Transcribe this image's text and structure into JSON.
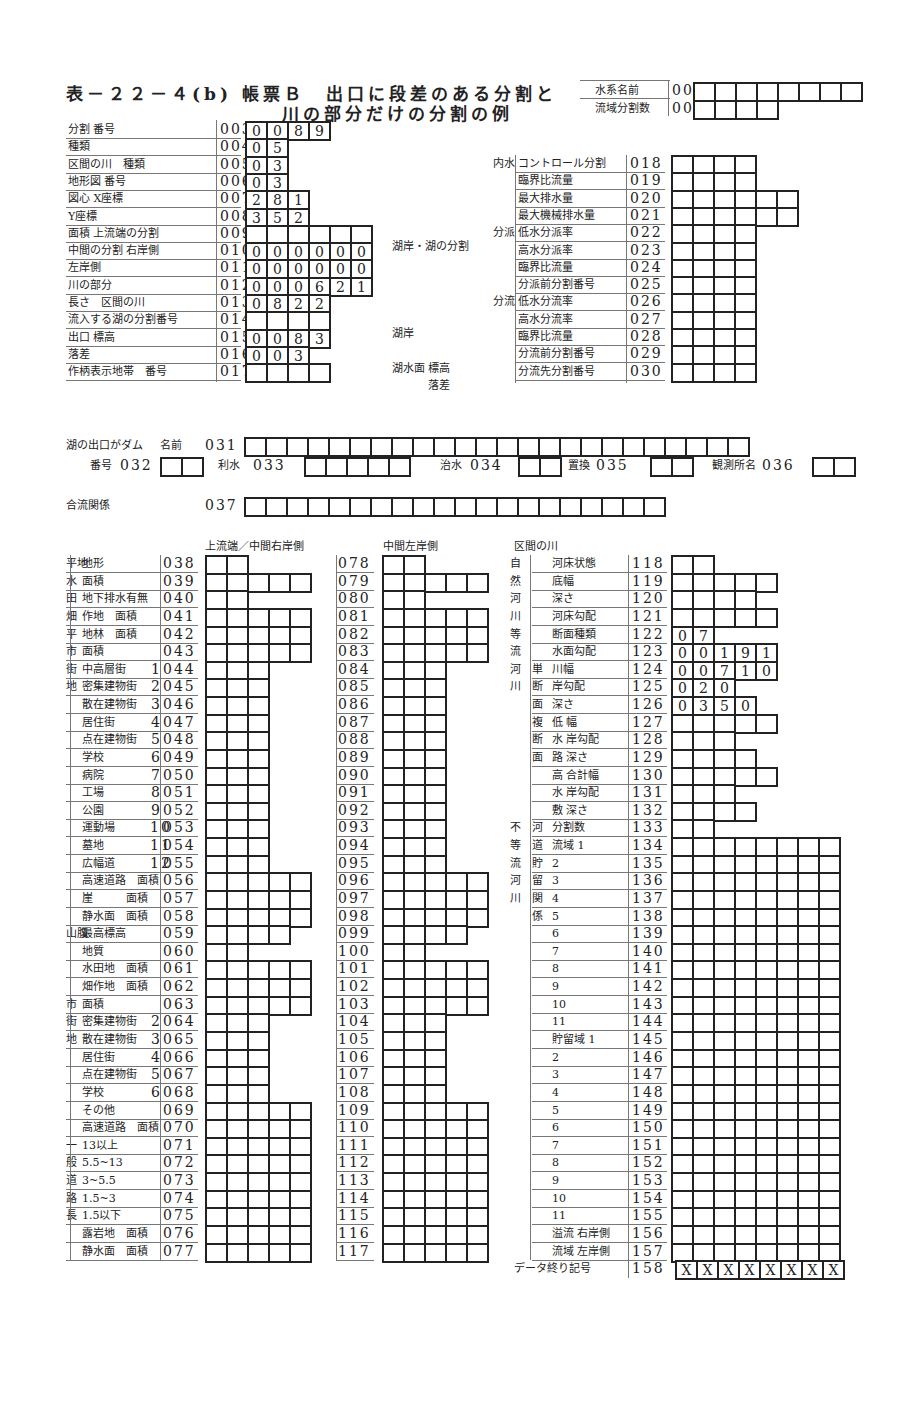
{
  "title": {
    "line1": "表－２２－４(b) 帳票Ｂ　出口に段差のある分割と",
    "line2": "川の部分だけの分割の例"
  },
  "header_fields": [
    {
      "label": "水系名前",
      "code": "001",
      "boxes": 8,
      "values": []
    },
    {
      "label": "流域分割数",
      "code": "002",
      "boxes": 4,
      "values": []
    }
  ],
  "section_top_left": [
    {
      "label": "分割 番号",
      "code": "003",
      "boxes": 4,
      "values": [
        "0",
        "0",
        "8",
        "9"
      ]
    },
    {
      "label": "種類",
      "code": "004",
      "boxes": 2,
      "values": [
        "0",
        "5"
      ]
    },
    {
      "label": "区間の川　種類",
      "code": "005",
      "boxes": 2,
      "values": [
        "0",
        "3"
      ]
    },
    {
      "label": "地形図 番号",
      "code": "006",
      "boxes": 2,
      "values": [
        "0",
        "3"
      ]
    },
    {
      "label": "図心 X座標",
      "code": "007",
      "boxes": 3,
      "values": [
        "2",
        "8",
        "1"
      ]
    },
    {
      "label": "Y座標",
      "code": "008",
      "boxes": 3,
      "values": [
        "3",
        "5",
        "2"
      ]
    },
    {
      "label": "面積 上流端の分割",
      "code": "009",
      "boxes": 6,
      "values": []
    },
    {
      "label": "中間の分割 右岸側",
      "code": "010",
      "boxes": 6,
      "values": [
        "0",
        "0",
        "0",
        "0",
        "0",
        "0"
      ]
    },
    {
      "label": "左岸側",
      "code": "011",
      "boxes": 6,
      "values": [
        "0",
        "0",
        "0",
        "0",
        "0",
        "0"
      ]
    },
    {
      "label": "川の部分",
      "code": "012",
      "boxes": 6,
      "values": [
        "0",
        "0",
        "0",
        "6",
        "2",
        "1"
      ]
    },
    {
      "label": "長さ　区間の川",
      "code": "013",
      "boxes": 4,
      "values": [
        "0",
        "8",
        "2",
        "2"
      ]
    },
    {
      "label": "流入する湖の分割番号",
      "code": "014",
      "boxes": 4,
      "values": []
    },
    {
      "label": "出口 標高",
      "code": "015",
      "boxes": 4,
      "values": [
        "0",
        "0",
        "8",
        "3"
      ]
    },
    {
      "label": "落差",
      "code": "016",
      "boxes": 3,
      "values": [
        "0",
        "0",
        "3"
      ]
    },
    {
      "label": "作柄表示地帯　番号",
      "code": "017",
      "boxes": 4,
      "values": []
    }
  ],
  "middle_labels": {
    "lake_shore_division": "湖岸・湖の分割",
    "lake_shore": "湖岸",
    "lake_surface_elev": "湖水面 標高",
    "drop": "落差"
  },
  "section_top_right": [
    {
      "group": "内水",
      "label": "コントロール分割",
      "code": "018",
      "boxes": 4
    },
    {
      "group": "",
      "label": "臨界比流量",
      "code": "019",
      "boxes": 4
    },
    {
      "group": "",
      "label": "最大排水量",
      "code": "020",
      "boxes": 6
    },
    {
      "group": "",
      "label": "最大機械排水量",
      "code": "021",
      "boxes": 6
    },
    {
      "group": "分派",
      "label": "低水分派率",
      "code": "022",
      "boxes": 4
    },
    {
      "group": "",
      "label": "高水分派率",
      "code": "023",
      "boxes": 4
    },
    {
      "group": "",
      "label": "臨界比流量",
      "code": "024",
      "boxes": 4
    },
    {
      "group": "",
      "label": "分派前分割番号",
      "code": "025",
      "boxes": 4
    },
    {
      "group": "分流",
      "label": "低水分流率",
      "code": "026",
      "boxes": 4
    },
    {
      "group": "",
      "label": "高水分流率",
      "code": "027",
      "boxes": 4
    },
    {
      "group": "",
      "label": "臨界比流量",
      "code": "028",
      "boxes": 4
    },
    {
      "group": "",
      "label": "分流前分割番号",
      "code": "029",
      "boxes": 4
    },
    {
      "group": "",
      "label": "分流先分割番号",
      "code": "030",
      "boxes": 4
    }
  ],
  "dam": {
    "label": "湖の出口がダム",
    "name_label": "名前",
    "name_code": "031",
    "name_boxes": 24,
    "number_label": "番号",
    "number_code": "032",
    "number_boxes": 2,
    "irrigation_label": "利水",
    "irrigation_code": "033",
    "irrigation_boxes": 5,
    "flood_label": "治水",
    "flood_code": "034",
    "flood_boxes": 2,
    "replace_label": "置換",
    "replace_code": "035",
    "replace_boxes": 2,
    "station_label": "観測所名",
    "station_code": "036",
    "station_boxes": 2
  },
  "confluence": {
    "label": "合流関係",
    "code": "037",
    "boxes": 20
  },
  "column_headers": {
    "upstream_right": "上流端／中間右岸側",
    "middle_left": "中間左岸側",
    "section_river": "区間の川"
  },
  "land_rows": [
    {
      "group": "平地",
      "label": "地形",
      "sub": "",
      "code": "038",
      "boxes": 2,
      "left_code": "078"
    },
    {
      "group": "水",
      "label": "面積",
      "sub": "",
      "code": "039",
      "boxes": 5,
      "left_code": "079"
    },
    {
      "group": "田",
      "label": "地下排水有無",
      "sub": "",
      "code": "040",
      "boxes": 2,
      "left_code": "080"
    },
    {
      "group": "畑",
      "label": "作地　面積",
      "sub": "",
      "code": "041",
      "boxes": 5,
      "left_code": "081"
    },
    {
      "group": "平",
      "label": "地林　面積",
      "sub": "",
      "code": "042",
      "boxes": 5,
      "left_code": "082"
    },
    {
      "group": "市",
      "label": "面積",
      "sub": "",
      "code": "043",
      "boxes": 5,
      "left_code": "083"
    },
    {
      "group": "街",
      "label": "中高層街",
      "sub": "1",
      "code": "044",
      "boxes": 3,
      "left_code": "084"
    },
    {
      "group": "地",
      "label": "密集建物街",
      "sub": "2",
      "code": "045",
      "boxes": 3,
      "left_code": "085"
    },
    {
      "group": "",
      "label": "散在建物街",
      "sub": "3",
      "code": "046",
      "boxes": 3,
      "left_code": "086"
    },
    {
      "group": "",
      "label": "居住街",
      "sub": "4",
      "code": "047",
      "boxes": 3,
      "left_code": "087"
    },
    {
      "group": "",
      "label": "点在建物街",
      "sub": "5",
      "code": "048",
      "boxes": 3,
      "left_code": "088"
    },
    {
      "group": "",
      "label": "学校",
      "sub": "6",
      "code": "049",
      "boxes": 3,
      "left_code": "089"
    },
    {
      "group": "",
      "label": "病院",
      "sub": "7",
      "code": "050",
      "boxes": 3,
      "left_code": "090"
    },
    {
      "group": "",
      "label": "工場",
      "sub": "8",
      "code": "051",
      "boxes": 3,
      "left_code": "091"
    },
    {
      "group": "",
      "label": "公園",
      "sub": "9",
      "code": "052",
      "boxes": 3,
      "left_code": "092"
    },
    {
      "group": "",
      "label": "運動場",
      "sub": "10",
      "code": "053",
      "boxes": 3,
      "left_code": "093"
    },
    {
      "group": "",
      "label": "墓地",
      "sub": "11",
      "code": "054",
      "boxes": 3,
      "left_code": "094"
    },
    {
      "group": "",
      "label": "広幅道",
      "sub": "12",
      "code": "055",
      "boxes": 3,
      "left_code": "095"
    },
    {
      "group": "",
      "label": "高速道路　面積",
      "sub": "",
      "code": "056",
      "boxes": 5,
      "left_code": "096"
    },
    {
      "group": "",
      "label": "崖　　　面積",
      "sub": "",
      "code": "057",
      "boxes": 5,
      "left_code": "097"
    },
    {
      "group": "",
      "label": "静水面　面積",
      "sub": "",
      "code": "058",
      "boxes": 5,
      "left_code": "098"
    },
    {
      "group": "山腹",
      "label": "最高標高",
      "sub": "",
      "code": "059",
      "boxes": 4,
      "left_code": "099"
    },
    {
      "group": "",
      "label": "地質",
      "sub": "",
      "code": "060",
      "boxes": 2,
      "left_code": "100"
    },
    {
      "group": "",
      "label": "水田地　面積",
      "sub": "",
      "code": "061",
      "boxes": 5,
      "left_code": "101"
    },
    {
      "group": "",
      "label": "畑作地　面積",
      "sub": "",
      "code": "062",
      "boxes": 5,
      "left_code": "102"
    },
    {
      "group": "市",
      "label": "面積",
      "sub": "",
      "code": "063",
      "boxes": 5,
      "left_code": "103"
    },
    {
      "group": "街",
      "label": "密集建物街",
      "sub": "2",
      "code": "064",
      "boxes": 3,
      "left_code": "104"
    },
    {
      "group": "地",
      "label": "散在建物街",
      "sub": "3",
      "code": "065",
      "boxes": 3,
      "left_code": "105"
    },
    {
      "group": "",
      "label": "居住街",
      "sub": "4",
      "code": "066",
      "boxes": 3,
      "left_code": "106"
    },
    {
      "group": "",
      "label": "点在建物街",
      "sub": "5",
      "code": "067",
      "boxes": 3,
      "left_code": "107"
    },
    {
      "group": "",
      "label": "学校",
      "sub": "6",
      "code": "068",
      "boxes": 3,
      "left_code": "108"
    },
    {
      "group": "",
      "label": "その他",
      "sub": "",
      "code": "069",
      "boxes": 5,
      "left_code": "109"
    },
    {
      "group": "",
      "label": "高速道路　面積",
      "sub": "",
      "code": "070",
      "boxes": 5,
      "left_code": "110"
    },
    {
      "group": "一",
      "label": "13以上",
      "sub": "",
      "code": "071",
      "boxes": 5,
      "left_code": "111"
    },
    {
      "group": "般",
      "label": "5.5~13",
      "sub": "",
      "code": "072",
      "boxes": 5,
      "left_code": "112"
    },
    {
      "group": "道",
      "label": "3~5.5",
      "sub": "",
      "code": "073",
      "boxes": 5,
      "left_code": "113"
    },
    {
      "group": "路",
      "label": "1.5~3",
      "sub": "",
      "code": "074",
      "boxes": 5,
      "left_code": "114"
    },
    {
      "group": "長",
      "label": "1.5以下",
      "sub": "",
      "code": "075",
      "boxes": 5,
      "left_code": "115"
    },
    {
      "group": "",
      "label": "露岩地　面積",
      "sub": "",
      "code": "076",
      "boxes": 5,
      "left_code": "116"
    },
    {
      "group": "",
      "label": "静水面　面積",
      "sub": "",
      "code": "077",
      "boxes": 5,
      "left_code": "117"
    }
  ],
  "river_rows": [
    {
      "g1": "自",
      "g2": "",
      "label": "河床状態",
      "code": "118",
      "boxes": 2,
      "values": []
    },
    {
      "g1": "然",
      "g2": "",
      "label": "底幅",
      "code": "119",
      "boxes": 5,
      "values": []
    },
    {
      "g1": "河",
      "g2": "",
      "label": "深さ",
      "code": "120",
      "boxes": 4,
      "values": []
    },
    {
      "g1": "川",
      "g2": "",
      "label": "河床勾配",
      "code": "121",
      "boxes": 5,
      "values": []
    },
    {
      "g1": "等",
      "g2": "",
      "label": "断面種類",
      "code": "122",
      "boxes": 2,
      "values": [
        "0",
        "7"
      ]
    },
    {
      "g1": "流",
      "g2": "",
      "label": "水面勾配",
      "code": "123",
      "boxes": 5,
      "values": [
        "0",
        "0",
        "1",
        "9",
        "1"
      ]
    },
    {
      "g1": "河",
      "g2": "単",
      "label": "川幅",
      "code": "124",
      "boxes": 5,
      "values": [
        "0",
        "0",
        "7",
        "1",
        "0"
      ]
    },
    {
      "g1": "川",
      "g2": "断",
      "label": "岸勾配",
      "code": "125",
      "boxes": 3,
      "values": [
        "0",
        "2",
        "0"
      ]
    },
    {
      "g1": "",
      "g2": "面",
      "label": "深さ",
      "code": "126",
      "boxes": 4,
      "values": [
        "0",
        "3",
        "5",
        "0"
      ]
    },
    {
      "g1": "",
      "g2": "複",
      "label": "低 幅",
      "code": "127",
      "boxes": 5,
      "values": []
    },
    {
      "g1": "",
      "g2": "断",
      "label": "水 岸勾配",
      "code": "128",
      "boxes": 3,
      "values": []
    },
    {
      "g1": "",
      "g2": "面",
      "label": "路 深さ",
      "code": "129",
      "boxes": 4,
      "values": []
    },
    {
      "g1": "",
      "g2": "",
      "label": "高 合計幅",
      "code": "130",
      "boxes": 5,
      "values": []
    },
    {
      "g1": "",
      "g2": "",
      "label": "水 岸勾配",
      "code": "131",
      "boxes": 3,
      "values": []
    },
    {
      "g1": "",
      "g2": "",
      "label": "敷 深さ",
      "code": "132",
      "boxes": 4,
      "values": []
    },
    {
      "g1": "不",
      "g2": "河",
      "label": "分割数",
      "code": "133",
      "boxes": 2,
      "values": []
    },
    {
      "g1": "等",
      "g2": "道",
      "label": "流域 1",
      "code": "134",
      "boxes": 8,
      "values": []
    },
    {
      "g1": "流",
      "g2": "貯",
      "label": "2",
      "code": "135",
      "boxes": 8,
      "values": []
    },
    {
      "g1": "河",
      "g2": "留",
      "label": "3",
      "code": "136",
      "boxes": 8,
      "values": []
    },
    {
      "g1": "川",
      "g2": "関",
      "label": "4",
      "code": "137",
      "boxes": 8,
      "values": []
    },
    {
      "g1": "",
      "g2": "係",
      "label": "5",
      "code": "138",
      "boxes": 8,
      "values": []
    },
    {
      "g1": "",
      "g2": "",
      "label": "6",
      "code": "139",
      "boxes": 8,
      "values": []
    },
    {
      "g1": "",
      "g2": "",
      "label": "7",
      "code": "140",
      "boxes": 8,
      "values": []
    },
    {
      "g1": "",
      "g2": "",
      "label": "8",
      "code": "141",
      "boxes": 8,
      "values": []
    },
    {
      "g1": "",
      "g2": "",
      "label": "9",
      "code": "142",
      "boxes": 8,
      "values": []
    },
    {
      "g1": "",
      "g2": "",
      "label": "10",
      "code": "143",
      "boxes": 8,
      "values": []
    },
    {
      "g1": "",
      "g2": "",
      "label": "11",
      "code": "144",
      "boxes": 8,
      "values": []
    },
    {
      "g1": "",
      "g2": "",
      "label": "貯留域 1",
      "code": "145",
      "boxes": 8,
      "values": []
    },
    {
      "g1": "",
      "g2": "",
      "label": "2",
      "code": "146",
      "boxes": 8,
      "values": []
    },
    {
      "g1": "",
      "g2": "",
      "label": "3",
      "code": "147",
      "boxes": 8,
      "values": []
    },
    {
      "g1": "",
      "g2": "",
      "label": "4",
      "code": "148",
      "boxes": 8,
      "values": []
    },
    {
      "g1": "",
      "g2": "",
      "label": "5",
      "code": "149",
      "boxes": 8,
      "values": []
    },
    {
      "g1": "",
      "g2": "",
      "label": "6",
      "code": "150",
      "boxes": 8,
      "values": []
    },
    {
      "g1": "",
      "g2": "",
      "label": "7",
      "code": "151",
      "boxes": 8,
      "values": []
    },
    {
      "g1": "",
      "g2": "",
      "label": "8",
      "code": "152",
      "boxes": 8,
      "values": []
    },
    {
      "g1": "",
      "g2": "",
      "label": "9",
      "code": "153",
      "boxes": 8,
      "values": []
    },
    {
      "g1": "",
      "g2": "",
      "label": "10",
      "code": "154",
      "boxes": 8,
      "values": []
    },
    {
      "g1": "",
      "g2": "",
      "label": "11",
      "code": "155",
      "boxes": 8,
      "values": []
    },
    {
      "g1": "",
      "g2": "",
      "label": "溢流 右岸側",
      "code": "156",
      "boxes": 8,
      "values": []
    },
    {
      "g1": "",
      "g2": "",
      "label": "流域 左岸側",
      "code": "157",
      "boxes": 8,
      "values": []
    }
  ],
  "end_marker": {
    "label": "データ終り記号",
    "code": "158",
    "boxes": 8,
    "values": [
      "X",
      "X",
      "X",
      "X",
      "X",
      "X",
      "X",
      "X"
    ]
  }
}
